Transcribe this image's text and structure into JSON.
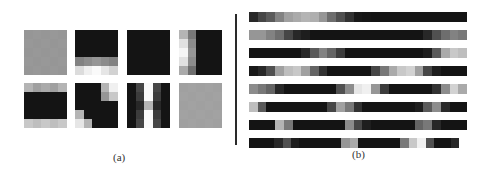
{
  "panels": {
    "a": {
      "label": "(a)",
      "tiles": [
        {
          "x": 24,
          "y": 30,
          "grid": [
            [
              150,
              152,
              150,
              152,
              150
            ],
            [
              152,
              150,
              152,
              150,
              152
            ],
            [
              150,
              152,
              150,
              152,
              150
            ],
            [
              152,
              150,
              152,
              150,
              152
            ],
            [
              150,
              152,
              150,
              152,
              150
            ]
          ]
        },
        {
          "x": 75,
          "y": 30,
          "grid": [
            [
              20,
              20,
              20,
              20,
              20
            ],
            [
              20,
              20,
              20,
              20,
              20
            ],
            [
              20,
              20,
              20,
              20,
              20
            ],
            [
              130,
              140,
              150,
              140,
              130
            ],
            [
              220,
              240,
              250,
              230,
              210
            ]
          ]
        },
        {
          "x": 127,
          "y": 30,
          "grid": [
            [
              20,
              20,
              20,
              20,
              20
            ],
            [
              20,
              20,
              20,
              20,
              20
            ],
            [
              20,
              20,
              20,
              20,
              20
            ],
            [
              20,
              20,
              20,
              20,
              20
            ],
            [
              20,
              20,
              20,
              20,
              20
            ]
          ]
        },
        {
          "x": 179,
          "y": 30,
          "grid": [
            [
              180,
              120,
              20,
              20,
              20
            ],
            [
              225,
              140,
              20,
              20,
              20
            ],
            [
              245,
              150,
              20,
              20,
              20
            ],
            [
              225,
              140,
              20,
              20,
              20
            ],
            [
              170,
              110,
              20,
              20,
              20
            ]
          ]
        },
        {
          "x": 24,
          "y": 83,
          "grid": [
            [
              180,
              160,
              170,
              160,
              180
            ],
            [
              20,
              20,
              20,
              20,
              20
            ],
            [
              20,
              20,
              20,
              20,
              20
            ],
            [
              20,
              20,
              20,
              20,
              20
            ],
            [
              200,
              190,
              200,
              190,
              200
            ]
          ]
        },
        {
          "x": 75,
          "y": 83,
          "grid": [
            [
              20,
              20,
              20,
              180,
              240
            ],
            [
              20,
              20,
              20,
              150,
              200
            ],
            [
              20,
              20,
              20,
              20,
              20
            ],
            [
              180,
              20,
              20,
              20,
              20
            ],
            [
              230,
              180,
              20,
              20,
              20
            ]
          ]
        },
        {
          "x": 127,
          "y": 83,
          "grid": [
            [
              20,
              70,
              250,
              70,
              20
            ],
            [
              20,
              60,
              250,
              60,
              20
            ],
            [
              20,
              40,
              180,
              40,
              20
            ],
            [
              20,
              60,
              250,
              60,
              20
            ],
            [
              20,
              70,
              250,
              70,
              20
            ]
          ]
        },
        {
          "x": 179,
          "y": 83,
          "grid": [
            [
              160,
              162,
              160,
              162,
              160
            ],
            [
              162,
              160,
              162,
              160,
              162
            ],
            [
              160,
              162,
              160,
              162,
              160
            ],
            [
              162,
              160,
              162,
              160,
              162
            ],
            [
              160,
              162,
              160,
              162,
              160
            ]
          ]
        }
      ]
    },
    "b": {
      "label": "(b)",
      "strips": [
        {
          "y": 12,
          "width": 218,
          "cells": [
            40,
            70,
            90,
            130,
            160,
            170,
            180,
            175,
            150,
            110,
            80,
            50,
            25,
            22,
            20,
            20,
            20,
            20,
            20,
            20,
            20,
            20,
            20,
            20,
            20
          ]
        },
        {
          "y": 30,
          "width": 218,
          "cells": [
            150,
            150,
            130,
            110,
            70,
            40,
            30,
            20,
            20,
            20,
            20,
            20,
            20,
            20,
            20,
            20,
            20,
            20,
            20,
            20,
            40,
            80,
            110,
            130,
            120
          ]
        },
        {
          "y": 48,
          "width": 218,
          "cells": [
            20,
            20,
            20,
            20,
            20,
            20,
            40,
            90,
            130,
            100,
            60,
            20,
            20,
            20,
            20,
            20,
            20,
            20,
            20,
            20,
            30,
            90,
            170,
            200,
            190
          ]
        },
        {
          "y": 66,
          "width": 218,
          "cells": [
            25,
            40,
            80,
            160,
            190,
            200,
            160,
            100,
            50,
            20,
            20,
            20,
            20,
            20,
            70,
            120,
            170,
            200,
            210,
            160,
            70,
            30,
            20,
            20,
            20
          ]
        },
        {
          "y": 84,
          "width": 218,
          "cells": [
            140,
            120,
            100,
            40,
            20,
            20,
            20,
            20,
            20,
            20,
            80,
            140,
            230,
            240,
            150,
            60,
            20,
            20,
            20,
            20,
            20,
            50,
            140,
            210,
            170
          ]
        },
        {
          "y": 102,
          "width": 218,
          "cells": [
            190,
            90,
            20,
            20,
            20,
            20,
            20,
            20,
            20,
            70,
            160,
            120,
            50,
            20,
            20,
            20,
            20,
            20,
            20,
            30,
            90,
            140,
            40,
            20,
            20
          ]
        },
        {
          "y": 120,
          "width": 218,
          "cells": [
            20,
            20,
            20,
            180,
            120,
            20,
            20,
            20,
            20,
            20,
            20,
            140,
            70,
            30,
            20,
            20,
            20,
            20,
            20,
            100,
            120,
            40,
            20,
            20,
            20
          ]
        },
        {
          "y": 138,
          "width": 210,
          "cells": [
            20,
            20,
            20,
            40,
            80,
            30,
            20,
            20,
            20,
            20,
            20,
            150,
            170,
            20,
            20,
            20,
            20,
            20,
            120,
            200,
            240,
            80,
            20,
            20,
            40
          ]
        }
      ]
    }
  }
}
